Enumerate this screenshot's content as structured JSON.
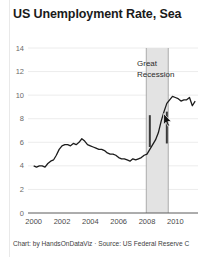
{
  "page": {
    "title": "US Unemployment Rate, Sea",
    "footer_credit": "Chart: by HandsOnDataViz · Source: US Federal Reserve C",
    "background_color": "#ffffff",
    "cursor_icon": "mouse-pointer-icon"
  },
  "annotations": {
    "recession_line1": "Great",
    "recession_line2": "Recession",
    "band_color": "#e3e3e3",
    "band_border_color": "#9a9a9a",
    "marker_color": "#3a3a3a"
  },
  "chart_data": {
    "type": "line",
    "title": "US Unemployment Rate, Sea",
    "xlabel": "",
    "ylabel": "",
    "xlim": [
      1999.6,
      2011.6
    ],
    "ylim": [
      0,
      14
    ],
    "grid": true,
    "legend": false,
    "line_color": "#1c1c1c",
    "xticks": [
      "2000",
      "2002",
      "2004",
      "2006",
      "2008",
      "2010"
    ],
    "xtick_values": [
      2000,
      2002,
      2004,
      2006,
      2008,
      2010
    ],
    "yticks": [
      "0",
      "2",
      "4",
      "6",
      "8",
      "10",
      "12",
      "14"
    ],
    "ytick_values": [
      0,
      2,
      4,
      6,
      8,
      10,
      12,
      14
    ],
    "shaded_region": {
      "label": "Great Recession",
      "x_start": 2007.95,
      "x_end": 2009.5
    },
    "markers": [
      {
        "x": 2008.2,
        "y_top": 8.3,
        "y_bottom": 5.6
      },
      {
        "x": 2009.4,
        "y_top": 8.6,
        "y_bottom": 5.9
      }
    ],
    "series": [
      {
        "name": "US Unemployment Rate",
        "x": [
          2000.0,
          2000.2,
          2000.4,
          2000.6,
          2000.8,
          2001.0,
          2001.2,
          2001.4,
          2001.6,
          2001.8,
          2002.0,
          2002.2,
          2002.4,
          2002.6,
          2002.8,
          2003.0,
          2003.2,
          2003.4,
          2003.6,
          2003.8,
          2004.0,
          2004.2,
          2004.4,
          2004.6,
          2004.8,
          2005.0,
          2005.2,
          2005.4,
          2005.6,
          2005.8,
          2006.0,
          2006.2,
          2006.4,
          2006.6,
          2006.8,
          2007.0,
          2007.2,
          2007.4,
          2007.6,
          2007.8,
          2008.0,
          2008.2,
          2008.4,
          2008.6,
          2008.8,
          2009.0,
          2009.2,
          2009.4,
          2009.6,
          2009.8,
          2010.0,
          2010.2,
          2010.4,
          2010.6,
          2010.8,
          2011.0,
          2011.2,
          2011.4
        ],
        "y": [
          4.0,
          3.9,
          4.0,
          4.0,
          3.9,
          4.2,
          4.4,
          4.5,
          4.9,
          5.4,
          5.7,
          5.8,
          5.8,
          5.7,
          5.9,
          5.8,
          6.0,
          6.3,
          6.1,
          5.8,
          5.7,
          5.6,
          5.5,
          5.4,
          5.4,
          5.3,
          5.1,
          5.0,
          5.0,
          4.9,
          4.7,
          4.6,
          4.6,
          4.5,
          4.4,
          4.6,
          4.5,
          4.6,
          4.7,
          4.9,
          5.0,
          5.4,
          5.8,
          6.2,
          6.8,
          7.8,
          8.6,
          9.3,
          9.6,
          9.9,
          9.8,
          9.7,
          9.5,
          9.6,
          9.6,
          9.8,
          9.1,
          9.5
        ]
      }
    ]
  }
}
